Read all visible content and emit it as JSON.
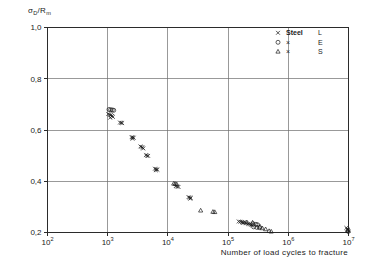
{
  "chart_data": {
    "type": "scatter",
    "title": "",
    "ylabel_main": "σ",
    "ylabel_sub": "D",
    "ylabel_rest": "/R",
    "ylabel_sub2": "m",
    "ylabel_full": "σD/Rm",
    "xlabel": "Number of load cycles to fracture",
    "xscale": "log",
    "yscale": "linear",
    "xlim": [
      100,
      10000000
    ],
    "ylim": [
      0.2,
      1.0
    ],
    "grid": true,
    "legend_position": "top-right",
    "x_ticks": [
      {
        "value": 100,
        "mantissa": "10",
        "exponent": "2"
      },
      {
        "value": 1000,
        "mantissa": "10",
        "exponent": "3"
      },
      {
        "value": 10000,
        "mantissa": "10",
        "exponent": "4"
      },
      {
        "value": 100000,
        "mantissa": "10",
        "exponent": "5"
      },
      {
        "value": 1000000,
        "mantissa": "10",
        "exponent": "6"
      },
      {
        "value": 10000000,
        "mantissa": "10",
        "exponent": "7"
      }
    ],
    "y_ticks": [
      {
        "value": 1.0,
        "label": "1,0"
      },
      {
        "value": 0.8,
        "label": "0,8"
      },
      {
        "value": 0.6,
        "label": "0,6"
      },
      {
        "value": 0.4,
        "label": "0,4"
      },
      {
        "value": 0.2,
        "label": "0,2"
      }
    ],
    "legend": [
      {
        "marker": "cross",
        "material": "Steel",
        "code": "L"
      },
      {
        "marker": "circle",
        "material": "×",
        "code": "E"
      },
      {
        "marker": "triangle",
        "material": "×",
        "code": "S"
      }
    ],
    "series": [
      {
        "name": "Steel L",
        "marker": "cross",
        "points": [
          [
            1020,
            0.662
          ],
          [
            1080,
            0.66
          ],
          [
            1130,
            0.658
          ],
          [
            1180,
            0.655
          ],
          [
            1100,
            0.648
          ],
          [
            1220,
            0.651
          ],
          [
            1600,
            0.629
          ],
          [
            1680,
            0.628
          ],
          [
            1740,
            0.627
          ],
          [
            2500,
            0.572
          ],
          [
            2600,
            0.571
          ],
          [
            2700,
            0.57
          ],
          [
            2580,
            0.566
          ],
          [
            3500,
            0.536
          ],
          [
            3650,
            0.534
          ],
          [
            3800,
            0.531
          ],
          [
            3900,
            0.528
          ],
          [
            4300,
            0.502
          ],
          [
            4500,
            0.5
          ],
          [
            4700,
            0.499
          ],
          [
            6100,
            0.449
          ],
          [
            6400,
            0.447
          ],
          [
            6700,
            0.445
          ],
          [
            6300,
            0.443
          ],
          [
            13500,
            0.381
          ],
          [
            14200,
            0.379
          ],
          [
            15000,
            0.378
          ],
          [
            22000,
            0.338
          ],
          [
            23000,
            0.336
          ],
          [
            24000,
            0.335
          ],
          [
            23500,
            0.332
          ],
          [
            150000,
            0.243
          ],
          [
            160000,
            0.242
          ],
          [
            170000,
            0.241
          ],
          [
            180000,
            0.24
          ],
          [
            175000,
            0.237
          ],
          [
            190000,
            0.239
          ],
          [
            200000,
            0.236
          ],
          [
            215000,
            0.234
          ],
          [
            225000,
            0.232
          ],
          [
            240000,
            0.23
          ],
          [
            250000,
            0.228
          ],
          [
            9200000,
            0.218
          ],
          [
            9600000,
            0.214
          ],
          [
            9800000,
            0.21
          ],
          [
            10000000,
            0.206
          ]
        ]
      },
      {
        "name": "Steel E",
        "marker": "circle",
        "points": [
          [
            1050,
            0.68
          ],
          [
            1120,
            0.679
          ],
          [
            1190,
            0.678
          ],
          [
            1260,
            0.677
          ],
          [
            260000,
            0.234
          ],
          [
            290000,
            0.232
          ],
          [
            310000,
            0.23
          ],
          [
            265000,
            0.222
          ],
          [
            300000,
            0.22
          ],
          [
            330000,
            0.219
          ],
          [
            9900000,
            0.204
          ]
        ]
      },
      {
        "name": "Steel S",
        "marker": "triangle",
        "points": [
          [
            12500,
            0.39
          ],
          [
            13200,
            0.389
          ],
          [
            14000,
            0.388
          ],
          [
            35000,
            0.285
          ],
          [
            56000,
            0.28
          ],
          [
            60000,
            0.279
          ],
          [
            205000,
            0.239
          ],
          [
            255000,
            0.238
          ],
          [
            340000,
            0.222
          ],
          [
            370000,
            0.216
          ],
          [
            420000,
            0.212
          ],
          [
            480000,
            0.205
          ],
          [
            520000,
            0.203
          ],
          [
            9700000,
            0.207
          ]
        ]
      }
    ]
  }
}
